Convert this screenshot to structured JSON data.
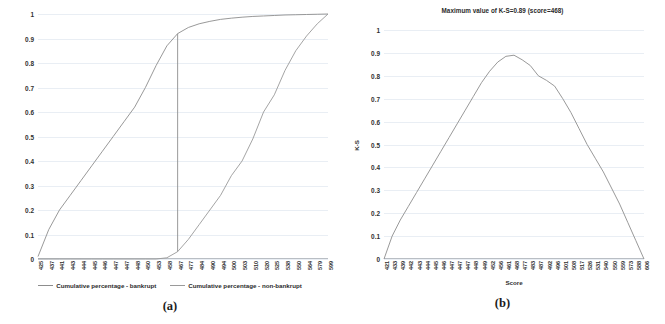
{
  "figure": {
    "panels": [
      {
        "caption": "(a)",
        "title": "",
        "y_ticks": [
          "1",
          "0.9",
          "0.8",
          "0.7",
          "0.6",
          "0.5",
          "0.4",
          "0.3",
          "0.2",
          "0.1",
          "0"
        ],
        "x_label": "",
        "y_label": "",
        "legend": [
          {
            "label": "Cumulative percentage - bankrupt",
            "color": "#8d8d8d"
          },
          {
            "label": "Cumulative percentage - non-bankrupt",
            "color": "#9a9a9a"
          }
        ]
      },
      {
        "caption": "(b)",
        "title": "Maximum value of K-S=0.89 (score=468)",
        "y_ticks": [
          "1",
          "0.9",
          "0.8",
          "0.7",
          "0.6",
          "0.5",
          "0.4",
          "0.3",
          "0.2",
          "0.1",
          "0"
        ],
        "x_label": "Score",
        "y_label": "K-S",
        "legend": []
      }
    ]
  },
  "chart_data": [
    {
      "type": "line",
      "title": "",
      "xlabel": "",
      "ylabel": "",
      "ylim": [
        0,
        1
      ],
      "grid": true,
      "legend_position": "bottom",
      "categories": [
        "425",
        "437",
        "441",
        "443",
        "444",
        "445",
        "446",
        "447",
        "447",
        "448",
        "450",
        "453",
        "458",
        "467",
        "477",
        "484",
        "490",
        "494",
        "500",
        "503",
        "510",
        "520",
        "525",
        "538",
        "550",
        "564",
        "579",
        "599"
      ],
      "series": [
        {
          "name": "Cumulative percentage - bankrupt",
          "color": "#8d8d8d",
          "values": [
            0.01,
            0.12,
            0.2,
            0.26,
            0.32,
            0.38,
            0.44,
            0.5,
            0.56,
            0.62,
            0.7,
            0.79,
            0.87,
            0.92,
            0.945,
            0.96,
            0.97,
            0.978,
            0.983,
            0.987,
            0.99,
            0.992,
            0.994,
            0.996,
            0.997,
            0.998,
            0.999,
            1.0
          ]
        },
        {
          "name": "Cumulative percentage - non-bankrupt",
          "color": "#9a9a9a",
          "values": [
            0.0,
            0.0,
            0.0,
            0.0,
            0.0,
            0.0,
            0.0,
            0.0,
            0.0,
            0.0,
            0.0,
            0.0,
            0.005,
            0.03,
            0.08,
            0.14,
            0.2,
            0.26,
            0.34,
            0.4,
            0.49,
            0.6,
            0.67,
            0.77,
            0.85,
            0.91,
            0.96,
            1.0
          ]
        }
      ]
    },
    {
      "type": "line",
      "title": "Maximum value of K-S=0.89 (score=468)",
      "xlabel": "Score",
      "ylabel": "K-S",
      "ylim": [
        0,
        1
      ],
      "grid": true,
      "legend_position": "none",
      "annotations": [
        {
          "text": "Maximum value of K-S=0.89 (score=468)",
          "k_s_max": 0.89,
          "score_at_max": 468
        }
      ],
      "categories": [
        "421",
        "433",
        "439",
        "442",
        "443",
        "444",
        "445",
        "446",
        "447",
        "447",
        "447",
        "448",
        "449",
        "452",
        "456",
        "461",
        "468",
        "477",
        "483",
        "487",
        "492",
        "496",
        "501",
        "508",
        "517",
        "526",
        "531",
        "540",
        "550",
        "559",
        "573",
        "588",
        "606"
      ],
      "series": [
        {
          "name": "K-S",
          "color": "#8d8d8d",
          "values": [
            0.0,
            0.1,
            0.17,
            0.23,
            0.29,
            0.35,
            0.41,
            0.47,
            0.53,
            0.59,
            0.65,
            0.71,
            0.77,
            0.82,
            0.86,
            0.885,
            0.89,
            0.87,
            0.845,
            0.8,
            0.78,
            0.755,
            0.7,
            0.64,
            0.57,
            0.5,
            0.44,
            0.38,
            0.31,
            0.24,
            0.16,
            0.08,
            0.0
          ]
        }
      ]
    }
  ]
}
